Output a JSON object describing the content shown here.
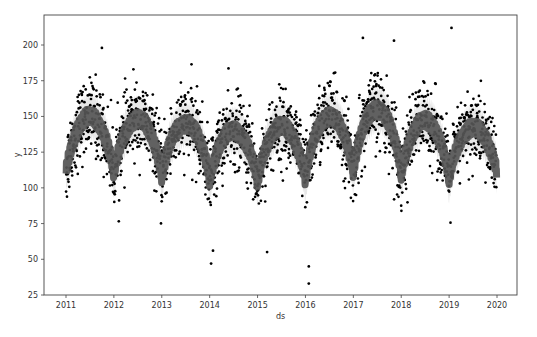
{
  "chart_data": {
    "type": "scatter",
    "title": "",
    "xlabel": "ds",
    "ylabel": "y",
    "x_ticks": [
      "2011",
      "2012",
      "2013",
      "2014",
      "2015",
      "2016",
      "2017",
      "2018",
      "2019",
      "2020"
    ],
    "y_ticks": [
      25,
      50,
      75,
      100,
      125,
      150,
      175,
      200
    ],
    "xlim": [
      2010.55,
      2020.45
    ],
    "ylim": [
      25,
      222
    ],
    "grid": false,
    "legend": null,
    "series": [
      {
        "name": "observed (y)",
        "kind": "scatter",
        "color": "#000000",
        "x_range": [
          2011.0,
          2019.99
        ],
        "approx_count": 3285,
        "notable_points": [
          {
            "x": 2019.05,
            "y": 212
          },
          {
            "x": 2017.2,
            "y": 205
          },
          {
            "x": 2017.85,
            "y": 203
          },
          {
            "x": 2011.75,
            "y": 198
          },
          {
            "x": 2016.07,
            "y": 45
          },
          {
            "x": 2016.07,
            "y": 33
          },
          {
            "x": 2014.07,
            "y": 56
          },
          {
            "x": 2014.03,
            "y": 47
          },
          {
            "x": 2015.2,
            "y": 55
          }
        ]
      },
      {
        "name": "forecast (yhat)",
        "kind": "line",
        "color": "#555555",
        "description": "annual seasonal curve; peaks ~mid-year, troughs at year start",
        "yearly_peaks": [
          {
            "year": 2011,
            "y": 150
          },
          {
            "year": 2012,
            "y": 148
          },
          {
            "year": 2013,
            "y": 145
          },
          {
            "year": 2014,
            "y": 140
          },
          {
            "year": 2015,
            "y": 143
          },
          {
            "year": 2016,
            "y": 150
          },
          {
            "year": 2017,
            "y": 155
          },
          {
            "year": 2018,
            "y": 147
          },
          {
            "year": 2019,
            "y": 142
          }
        ],
        "yearly_troughs": [
          {
            "year": 2011,
            "y": 110
          },
          {
            "year": 2012,
            "y": 108
          },
          {
            "year": 2013,
            "y": 106
          },
          {
            "year": 2014,
            "y": 104
          },
          {
            "year": 2015,
            "y": 102
          },
          {
            "year": 2016,
            "y": 104
          },
          {
            "year": 2017,
            "y": 110
          },
          {
            "year": 2018,
            "y": 108
          },
          {
            "year": 2019,
            "y": 104
          },
          {
            "year": 2020,
            "y": 110
          }
        ]
      },
      {
        "name": "uncertainty interval",
        "kind": "area",
        "color": "#e6e6e6",
        "half_width": 15
      }
    ]
  },
  "layout": {
    "plot_left": 44,
    "plot_top": 15,
    "plot_right": 517,
    "plot_bottom": 295,
    "x_first_tick_px": 66,
    "x_last_tick_px": 497,
    "y_25_px": 295,
    "y_200_px": 45
  }
}
